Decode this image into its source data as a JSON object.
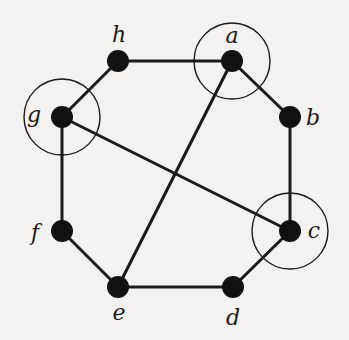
{
  "graph": {
    "nodes": [
      {
        "id": "a",
        "label": "a",
        "x": 232,
        "y": 61,
        "lx": 232,
        "ly": 43,
        "anchor": "middle",
        "highlighted": true
      },
      {
        "id": "b",
        "label": "b",
        "x": 290,
        "y": 117,
        "lx": 313,
        "ly": 125,
        "anchor": "middle",
        "highlighted": false
      },
      {
        "id": "c",
        "label": "c",
        "x": 290,
        "y": 231,
        "lx": 314,
        "ly": 238,
        "anchor": "middle",
        "highlighted": true
      },
      {
        "id": "d",
        "label": "d",
        "x": 233,
        "y": 287,
        "lx": 233,
        "ly": 325,
        "anchor": "middle",
        "highlighted": false
      },
      {
        "id": "e",
        "label": "e",
        "x": 118,
        "y": 287,
        "lx": 119,
        "ly": 320,
        "anchor": "middle",
        "highlighted": false
      },
      {
        "id": "f",
        "label": "f",
        "x": 62,
        "y": 231,
        "lx": 35,
        "ly": 240,
        "anchor": "middle",
        "highlighted": false
      },
      {
        "id": "g",
        "label": "g",
        "x": 62,
        "y": 117,
        "lx": 34,
        "ly": 122,
        "anchor": "middle",
        "highlighted": true
      },
      {
        "id": "h",
        "label": "h",
        "x": 118,
        "y": 61,
        "lx": 119,
        "ly": 42,
        "anchor": "middle",
        "highlighted": false
      }
    ],
    "edges": [
      [
        "h",
        "a"
      ],
      [
        "h",
        "g"
      ],
      [
        "a",
        "b"
      ],
      [
        "b",
        "c"
      ],
      [
        "c",
        "d"
      ],
      [
        "d",
        "e"
      ],
      [
        "e",
        "f"
      ],
      [
        "f",
        "g"
      ],
      [
        "g",
        "c"
      ],
      [
        "a",
        "e"
      ]
    ],
    "node_radius": 11,
    "ring_radius": 38
  }
}
